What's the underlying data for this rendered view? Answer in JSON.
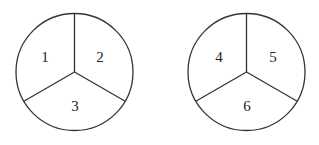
{
  "diagram": {
    "circles": [
      {
        "id": "spinner-1",
        "center": [
          74.5,
          72
        ],
        "radius": 58.5,
        "sectors": [
          {
            "label": "1",
            "position": "upper-left",
            "text_pos": [
              45,
              58
            ]
          },
          {
            "label": "2",
            "position": "upper-right",
            "text_pos": [
              100,
              58
            ]
          },
          {
            "label": "3",
            "position": "bottom",
            "text_pos": [
              75,
              111
            ]
          }
        ]
      },
      {
        "id": "spinner-2",
        "center": [
          246.5,
          72
        ],
        "radius": 58.5,
        "sectors": [
          {
            "label": "4",
            "position": "upper-left",
            "text_pos": [
              219,
              58
            ]
          },
          {
            "label": "5",
            "position": "upper-right",
            "text_pos": [
              273,
              58
            ]
          },
          {
            "label": "6",
            "position": "bottom",
            "text_pos": [
              247,
              111
            ]
          }
        ]
      }
    ],
    "colors": {
      "stroke": "#333333",
      "background": "#ffffff",
      "text": "#222222"
    }
  }
}
